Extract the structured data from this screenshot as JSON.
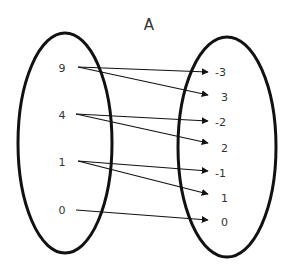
{
  "title": "A",
  "domain_set": {
    "elements": [
      {
        "label": "9",
        "x": 62,
        "y": 72
      },
      {
        "label": "4",
        "x": 62,
        "y": 119
      },
      {
        "label": "1",
        "x": 62,
        "y": 166
      },
      {
        "label": "0",
        "x": 62,
        "y": 214
      }
    ]
  },
  "codomain_set": {
    "elements": [
      {
        "label": "-3",
        "x": 216,
        "y": 76
      },
      {
        "label": "3",
        "x": 222,
        "y": 101
      },
      {
        "label": "-2",
        "x": 216,
        "y": 126
      },
      {
        "label": "2",
        "x": 222,
        "y": 152
      },
      {
        "label": "-1",
        "x": 216,
        "y": 177
      },
      {
        "label": "1",
        "x": 222,
        "y": 202
      },
      {
        "label": "0",
        "x": 222,
        "y": 226
      }
    ]
  },
  "mappings": [
    {
      "from": "9",
      "to": "-3"
    },
    {
      "from": "9",
      "to": "3"
    },
    {
      "from": "4",
      "to": "-2"
    },
    {
      "from": "4",
      "to": "2"
    },
    {
      "from": "1",
      "to": "-1"
    },
    {
      "from": "1",
      "to": "1"
    },
    {
      "from": "0",
      "to": "0"
    }
  ]
}
